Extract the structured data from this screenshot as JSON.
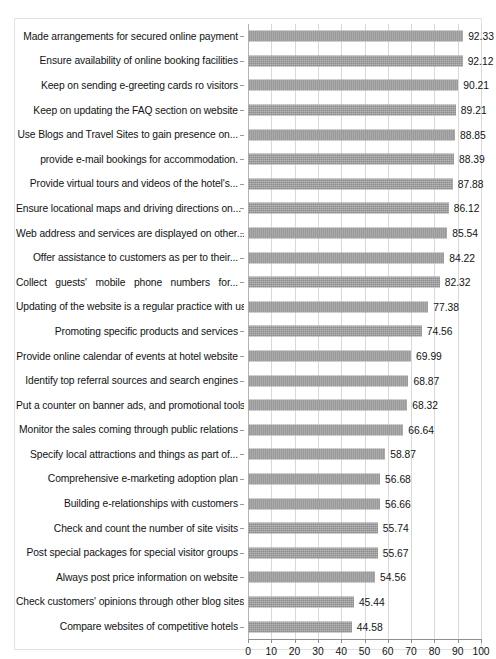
{
  "chart_data": {
    "type": "bar",
    "orientation": "horizontal",
    "title": "",
    "subtitle": "",
    "xlabel": "",
    "ylabel": "",
    "xlim": [
      0,
      100
    ],
    "xticks": [
      "0",
      "10",
      "20",
      "30",
      "40",
      "50",
      "60",
      "70",
      "80",
      "90",
      "100"
    ],
    "grid": true,
    "legend": false,
    "legend_position": "none",
    "bar_color": "#8d8d8d",
    "value_label_format": "2 decimals",
    "categories": [
      "Made arrangements for secured online payment",
      "Ensure availability of online booking facilities",
      "Keep on sending e-greeting cards ro visitors",
      "Keep on updating the FAQ section on website",
      "Use Blogs and Travel Sites to gain presence on...",
      "provide e-mail bookings for accommodation.",
      "Provide virtual tours and videos of the hotel's...",
      "Ensure locational maps and driving directions on...",
      "Web address and services are displayed on other...",
      "Offer assistance to customers as per to their...",
      "Collect guests' mobile phone numbers for...",
      "Updating of the website is a regular practice with us",
      "Promoting specific products and services",
      "Provide online calendar of events at hotel website",
      "Identify top referral sources and search engines",
      "Put a counter on banner ads, and promotional tools",
      "Monitor the sales coming through public relations",
      "Specify local attractions and things as part of...",
      "Comprehensive e-marketing adoption plan",
      "Building e-relationships with customers",
      "Check and count the number of site visits",
      "Post special packages for special visitor groups",
      "Always post price information on website",
      "Check customers' opinions through other blog sites",
      "Compare websites of competitive hotels"
    ],
    "values": [
      92.33,
      92.12,
      90.21,
      89.21,
      88.85,
      88.39,
      87.88,
      86.12,
      85.54,
      84.22,
      82.32,
      77.38,
      74.56,
      69.99,
      68.87,
      68.32,
      66.64,
      58.87,
      56.68,
      56.66,
      55.74,
      55.67,
      54.56,
      45.44,
      44.58
    ],
    "value_labels": [
      "92.33",
      "92.12",
      "90.21",
      "89.21",
      "88.85",
      "88.39",
      "87.88",
      "86.12",
      "85.54",
      "84.22",
      "82.32",
      "77.38",
      "74.56",
      "69.99",
      "68.87",
      "68.32",
      "66.64",
      "58.87",
      "56.68",
      "56.66",
      "55.74",
      "55.67",
      "54.56",
      "45.44",
      "44.58"
    ],
    "justified_categories": [
      10
    ]
  }
}
